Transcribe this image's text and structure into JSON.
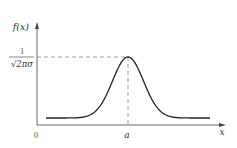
{
  "chart_data": {
    "type": "line",
    "title": "",
    "xlabel": "x",
    "ylabel": "f(x)",
    "function": "f(x) = 1/(sqrt(2*pi)*sigma) * exp(-(x-a)^2/(2*sigma^2))",
    "x_ticks": [
      "0",
      "a"
    ],
    "y_ticks": [
      "1/(√2πσ)"
    ],
    "peak": {
      "x": "a",
      "y": "1/(√2πσ)"
    },
    "annotations": [
      "dashed vertical line at x = a",
      "dashed horizontal line at y = 1/(√2πσ)"
    ],
    "grid": false,
    "legend": null
  },
  "labels": {
    "y_axis": "f(x)",
    "x_axis": "x",
    "origin": "0",
    "mean": "a",
    "peak_numerator": "1",
    "peak_denominator": "√2πσ"
  },
  "colors": {
    "curve": "#222222",
    "axes": "#555555",
    "dashed": "#888888"
  }
}
